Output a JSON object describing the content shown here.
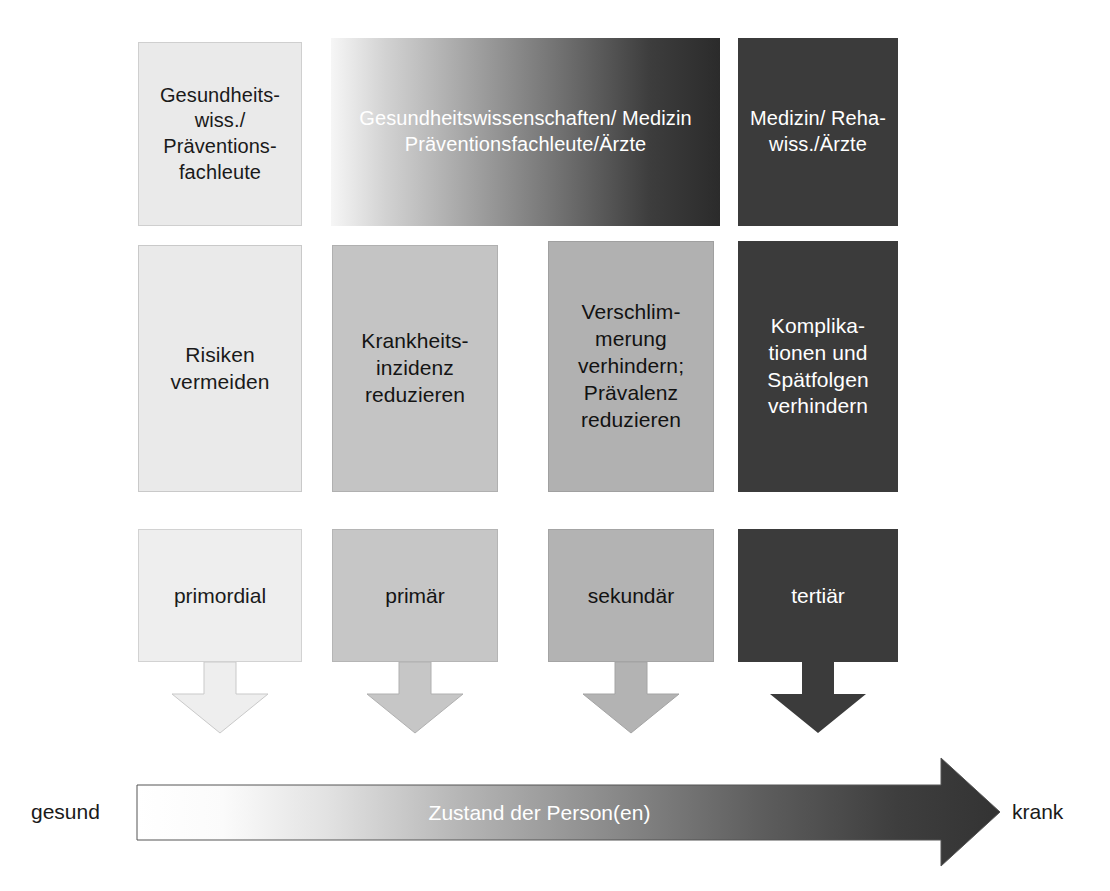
{
  "diagram": {
    "title_semantic": "prevention-levels-disease-continuum",
    "colors": {
      "lightest": "#eaeaea",
      "light": "#c4c4c4",
      "medium": "#b1b1b1",
      "dark": "#3b3b3b",
      "text_dark": "#1a1a1a",
      "text_light": "#ffffff"
    },
    "actors": [
      {
        "text": "Gesundheits-\nwiss./\nPräventions-\nfachleute"
      },
      {
        "text": "Gesundheitswissenschaften/ Medizin\nPräventionsfachleute/Ärzte"
      },
      {
        "text": "Medizin/ Reha-\nwiss./Ärzte"
      }
    ],
    "goals": [
      {
        "text": "Risiken\nvermeiden"
      },
      {
        "text": "Krankheits-\ninzidenz\nreduzieren"
      },
      {
        "text": "Verschlim-\nmerung\nverhindern;\nPrävalenz\nreduzieren"
      },
      {
        "text": "Komplika-\ntionen und\nSpätfolgen\nverhindern"
      }
    ],
    "levels": [
      {
        "label": "primordial"
      },
      {
        "label": "primär"
      },
      {
        "label": "sekundär"
      },
      {
        "label": "tertiär"
      }
    ],
    "continuum": {
      "label": "Zustand der Person(en)",
      "start_label": "gesund",
      "end_label": "krank"
    }
  }
}
